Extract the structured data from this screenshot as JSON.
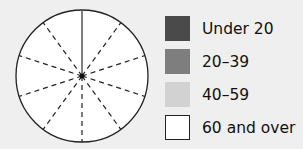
{
  "chart_data": {
    "type": "pie",
    "title": "",
    "sectors": 10,
    "values": [],
    "note": "Empty pie chart template divided into 10 equal sectors (dashed lines), with one solid radius at top",
    "legend": [
      {
        "label": "Under 20",
        "color": "#4a4a4a"
      },
      {
        "label": "20–39",
        "color": "#7e7e7e"
      },
      {
        "label": "40–59",
        "color": "#d2d2d2"
      },
      {
        "label": "60 and over",
        "color": "#ffffff"
      }
    ]
  }
}
